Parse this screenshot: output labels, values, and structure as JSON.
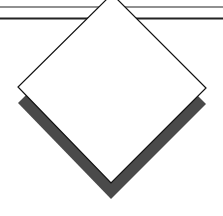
{
  "figure": {
    "colors": {
      "background": "#ffffff",
      "outline": "#111111",
      "diamond_fill": "#ffffff",
      "shadow_fill": "#4a4a4a",
      "rule": "#222222"
    },
    "diamond": {
      "top": [
        112,
        -6
      ],
      "right": [
        206,
        88
      ],
      "bottom": [
        111,
        183
      ],
      "left": [
        18,
        87
      ]
    },
    "shadow_offset_y": 16,
    "rules": [
      {
        "y": 7,
        "width": 1
      },
      {
        "y": 18.5,
        "width": 2
      }
    ]
  }
}
